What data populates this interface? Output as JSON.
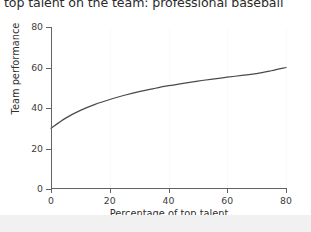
{
  "chart_title": "top talent on the team: professional baseball",
  "footer": {
    "band_color": "#f1f1f1"
  },
  "colors": {
    "line": "#4a4a4a",
    "axis": "#636363",
    "tick_text": "#3d3d3d",
    "title_text": "#2b2b2b",
    "background": "#ffffff"
  },
  "chart_data": {
    "type": "line",
    "title": "top talent on the team: professional baseball",
    "xlabel": "Percentage of top talent",
    "ylabel": "Team performance",
    "xlim": [
      0,
      80
    ],
    "ylim": [
      0,
      80
    ],
    "xticks": [
      "0",
      "20",
      "40",
      "60",
      "80"
    ],
    "yticks": [
      "0",
      "20",
      "40",
      "60",
      "80"
    ],
    "xtick_values": [
      0,
      20,
      40,
      60,
      80
    ],
    "ytick_values": [
      0,
      20,
      40,
      60,
      80
    ],
    "grid": false,
    "legend": null,
    "series": [
      {
        "name": "Team performance vs percentage of top talent",
        "x": [
          0,
          5,
          10,
          15,
          20,
          25,
          30,
          35,
          40,
          45,
          50,
          55,
          60,
          65,
          70,
          75,
          80
        ],
        "values": [
          30.0,
          35.0,
          38.8,
          41.8,
          44.2,
          46.3,
          48.1,
          49.6,
          51.0,
          52.2,
          53.3,
          54.3,
          55.2,
          56.1,
          57.0,
          58.4,
          60.0
        ]
      }
    ]
  }
}
